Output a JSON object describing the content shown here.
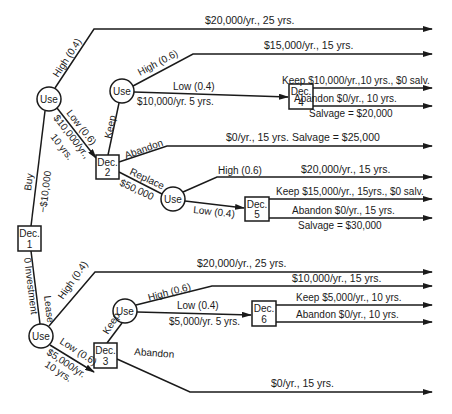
{
  "diagram": {
    "type": "decision-tree",
    "nodes": {
      "dec1": {
        "line1": "Dec.",
        "line2": "1"
      },
      "dec2": {
        "line1": "Dec.",
        "line2": "2"
      },
      "dec3": {
        "line1": "Dec.",
        "line2": "3"
      },
      "dec4": {
        "line1": "Dec.",
        "line2": "4"
      },
      "dec5": {
        "line1": "Dec.",
        "line2": "5"
      },
      "dec6": {
        "line1": "Dec.",
        "line2": "6"
      },
      "use1": "Use",
      "use2": "Use",
      "use3": "Use",
      "use4": "Use",
      "use5": "Use"
    },
    "edge_labels": {
      "buy": "Buy",
      "buy_cost": "−$10,000",
      "lease": "Lease",
      "lease_cost": "0 Investment",
      "buy_high": "High (0.4)",
      "buy_low": "Low (0.6)",
      "buy_low_value1": "$10,000/yr.,",
      "buy_low_value2": "10 yrs.",
      "dec2_keep": "Keep",
      "dec2_abandon": "Abandon",
      "dec2_replace": "Replace",
      "dec2_replace_cost": "$50,000",
      "use2_high": "High (0.6)",
      "use2_low": "Low  (0.4)",
      "use2_low_value": "$10,000/yr. 5 yrs.",
      "use3_high": "High (0.6)",
      "use3_low": "Low (0.4)",
      "lease_high": "High (0.4)",
      "lease_low": "Low (0.6)",
      "lease_low_value1": "$5,000/yr.",
      "lease_low_value2": "10 yrs.",
      "dec3_keep": "Keep",
      "dec3_abandon": "Abandon",
      "use5_high": "High (0.6)",
      "use5_low": "Low (0.4)",
      "use5_low_value": "$5,000/yr. 5 yrs."
    },
    "outcomes": [
      {
        "id": "o1",
        "text": "$20,000/yr.,   25 yrs."
      },
      {
        "id": "o2",
        "text": "$15,000/yr., 15 yrs."
      },
      {
        "id": "o3",
        "text": "Keep $10,000/yr.,10 yrs., $0 salv."
      },
      {
        "id": "o4",
        "text": "Abandon  $0/yr.,  10 yrs.",
        "sub": "Salvage = $20,000"
      },
      {
        "id": "o5",
        "text": "$0/yr.,  15 yrs. Salvage = $25,000"
      },
      {
        "id": "o6",
        "text": "$20,000/yr., 15 yrs."
      },
      {
        "id": "o7",
        "text": "Keep $15,000/yr., 15yrs., $0 salv."
      },
      {
        "id": "o8",
        "text": "Abandon $0/yr., 15 yrs.",
        "sub": "Salvage = $30,000"
      },
      {
        "id": "o9",
        "text": "$20,000/yr., 25 yrs."
      },
      {
        "id": "o10",
        "text": "$10,000/yr., 15 yrs."
      },
      {
        "id": "o11",
        "text": "Keep $5,000/yr., 10 yrs."
      },
      {
        "id": "o12",
        "text": "Abandon  $0/yr., 10 yrs."
      },
      {
        "id": "o13",
        "text": "$0/yr., 15 yrs."
      }
    ]
  }
}
